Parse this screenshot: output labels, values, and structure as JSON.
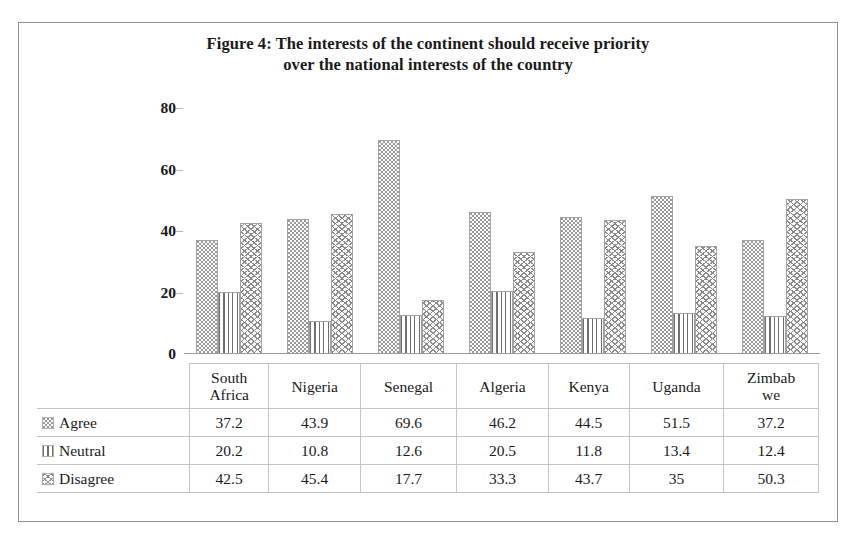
{
  "figure": {
    "title_line1": "Figure 4: The interests of the continent should receive priority",
    "title_line2": "over the national interests of the country"
  },
  "legend": {
    "items": [
      {
        "label": "Agree",
        "swatch": "dotted-stipple-swatch"
      },
      {
        "label": "Neutral",
        "swatch": "vertical-lines-swatch"
      },
      {
        "label": "Disagree",
        "swatch": "zigzag-crosshatch-swatch"
      }
    ]
  },
  "axis": {
    "y_ticks": [
      "0",
      "20",
      "40",
      "60",
      "80"
    ]
  },
  "chart_data": {
    "type": "bar",
    "title": "Figure 4: The interests of the continent should receive priority over the national interests of the country",
    "xlabel": "",
    "ylabel": "",
    "ylim": [
      0,
      80
    ],
    "yticks": [
      0,
      20,
      40,
      60,
      80
    ],
    "grid": false,
    "legend_position": "table-row-headers",
    "categories": [
      "South Africa",
      "Nigeria",
      "Senegal",
      "Algeria",
      "Kenya",
      "Uganda",
      "Zimbabwe"
    ],
    "category_labels": [
      [
        "South",
        "Africa"
      ],
      [
        "Nigeria"
      ],
      [
        "Senegal"
      ],
      [
        "Algeria"
      ],
      [
        "Kenya"
      ],
      [
        "Uganda"
      ],
      [
        "Zimbab",
        "we"
      ]
    ],
    "series": [
      {
        "name": "Agree",
        "values": [
          37.2,
          43.9,
          69.6,
          46.2,
          44.5,
          51.5,
          37.2
        ]
      },
      {
        "name": "Neutral",
        "values": [
          20.2,
          10.8,
          12.6,
          20.5,
          11.8,
          13.4,
          12.4
        ]
      },
      {
        "name": "Disagree",
        "values": [
          42.5,
          45.4,
          17.7,
          33.3,
          43.7,
          35.0,
          50.3
        ]
      }
    ],
    "value_labels": {
      "Agree": [
        "37.2",
        "43.9",
        "69.6",
        "46.2",
        "44.5",
        "51.5",
        "37.2"
      ],
      "Neutral": [
        "20.2",
        "10.8",
        "12.6",
        "20.5",
        "11.8",
        "13.4",
        "12.4"
      ],
      "Disagree": [
        "42.5",
        "45.4",
        "17.7",
        "33.3",
        "43.7",
        "35",
        "50.3"
      ]
    }
  }
}
